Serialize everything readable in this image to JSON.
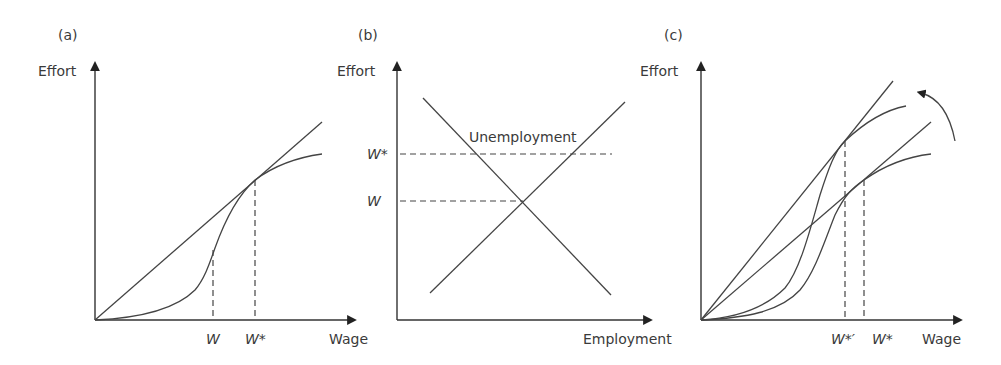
{
  "panels": [
    {
      "id": "a",
      "label": "(a)",
      "y_axis_label": "Effort",
      "x_axis_label": "Wage",
      "x_ticks": [
        "W",
        "W*"
      ],
      "elements": [
        "ray from origin tangent to effort curve",
        "S-shaped effort curve"
      ]
    },
    {
      "id": "b",
      "label": "(b)",
      "y_axis_label": "Effort",
      "x_axis_label": "Employment",
      "y_ticks": [
        "W*",
        "W"
      ],
      "annotation": "Unemployment",
      "elements": [
        "downward-sloping demand line",
        "upward-sloping supply line"
      ]
    },
    {
      "id": "c",
      "label": "(c)",
      "y_axis_label": "Effort",
      "x_axis_label": "Wage",
      "x_ticks": [
        "W*′",
        "W*"
      ],
      "elements": [
        "two rays from origin",
        "two S-shaped effort curves",
        "curved arrow indicating upward shift"
      ]
    }
  ]
}
